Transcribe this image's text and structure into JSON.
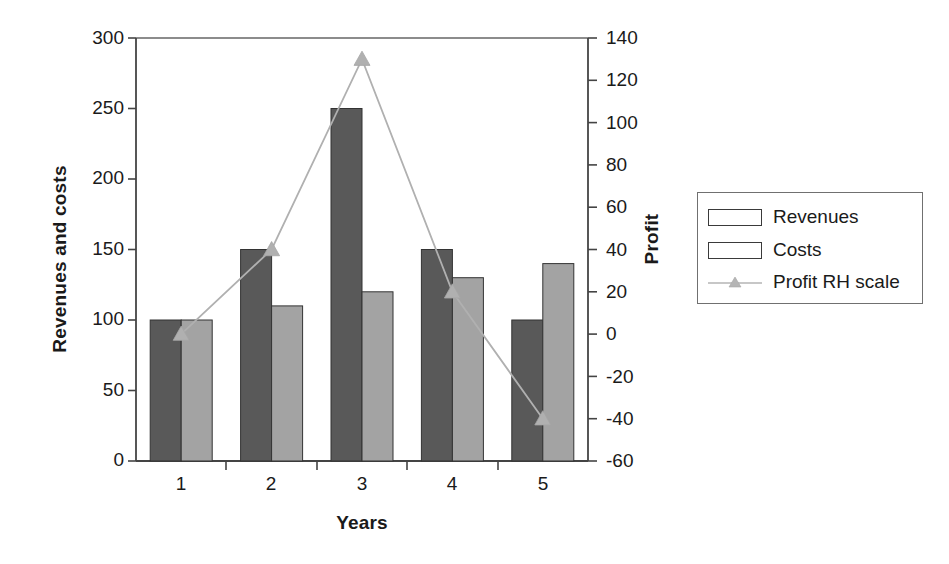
{
  "chart_data": {
    "type": "bar",
    "title": "",
    "xlabel": "Years",
    "ylabel": "Revenues and costs",
    "y2label": "Profit",
    "categories": [
      "1",
      "2",
      "3",
      "4",
      "5"
    ],
    "series": [
      {
        "name": "Revenues",
        "type": "bar",
        "axis": "left",
        "color": "#595959",
        "values": [
          100,
          150,
          250,
          150,
          100
        ]
      },
      {
        "name": "Costs",
        "type": "bar",
        "axis": "left",
        "color": "#a3a3a3",
        "values": [
          100,
          110,
          120,
          130,
          140
        ]
      },
      {
        "name": "Profit RH scale",
        "type": "line",
        "axis": "right",
        "color": "#b0b0b0",
        "values": [
          0,
          40,
          130,
          20,
          -40
        ]
      }
    ],
    "ylim": [
      0,
      300
    ],
    "yticks": [
      "0",
      "50",
      "100",
      "150",
      "200",
      "250",
      "300"
    ],
    "y2lim": [
      -60,
      140
    ],
    "y2ticks": [
      "-60",
      "-40",
      "-20",
      "0",
      "20",
      "40",
      "60",
      "80",
      "100",
      "120",
      "140"
    ],
    "grid": false,
    "legend_position": "right",
    "legend_entries": [
      "Revenues",
      "Costs",
      "Profit RH scale"
    ]
  },
  "legend": {
    "items": [
      {
        "label": "Revenues",
        "marker": "dark-gray-swatch"
      },
      {
        "label": "Costs",
        "marker": "light-gray-swatch"
      },
      {
        "label": "Profit RH scale",
        "marker": "line-triangle-marker"
      }
    ]
  },
  "colors": {
    "revenues": "#595959",
    "costs": "#a3a3a3",
    "profit_line": "#b0b0b0",
    "axis": "#555555",
    "text": "#1a1a1a",
    "background": "#ffffff"
  }
}
